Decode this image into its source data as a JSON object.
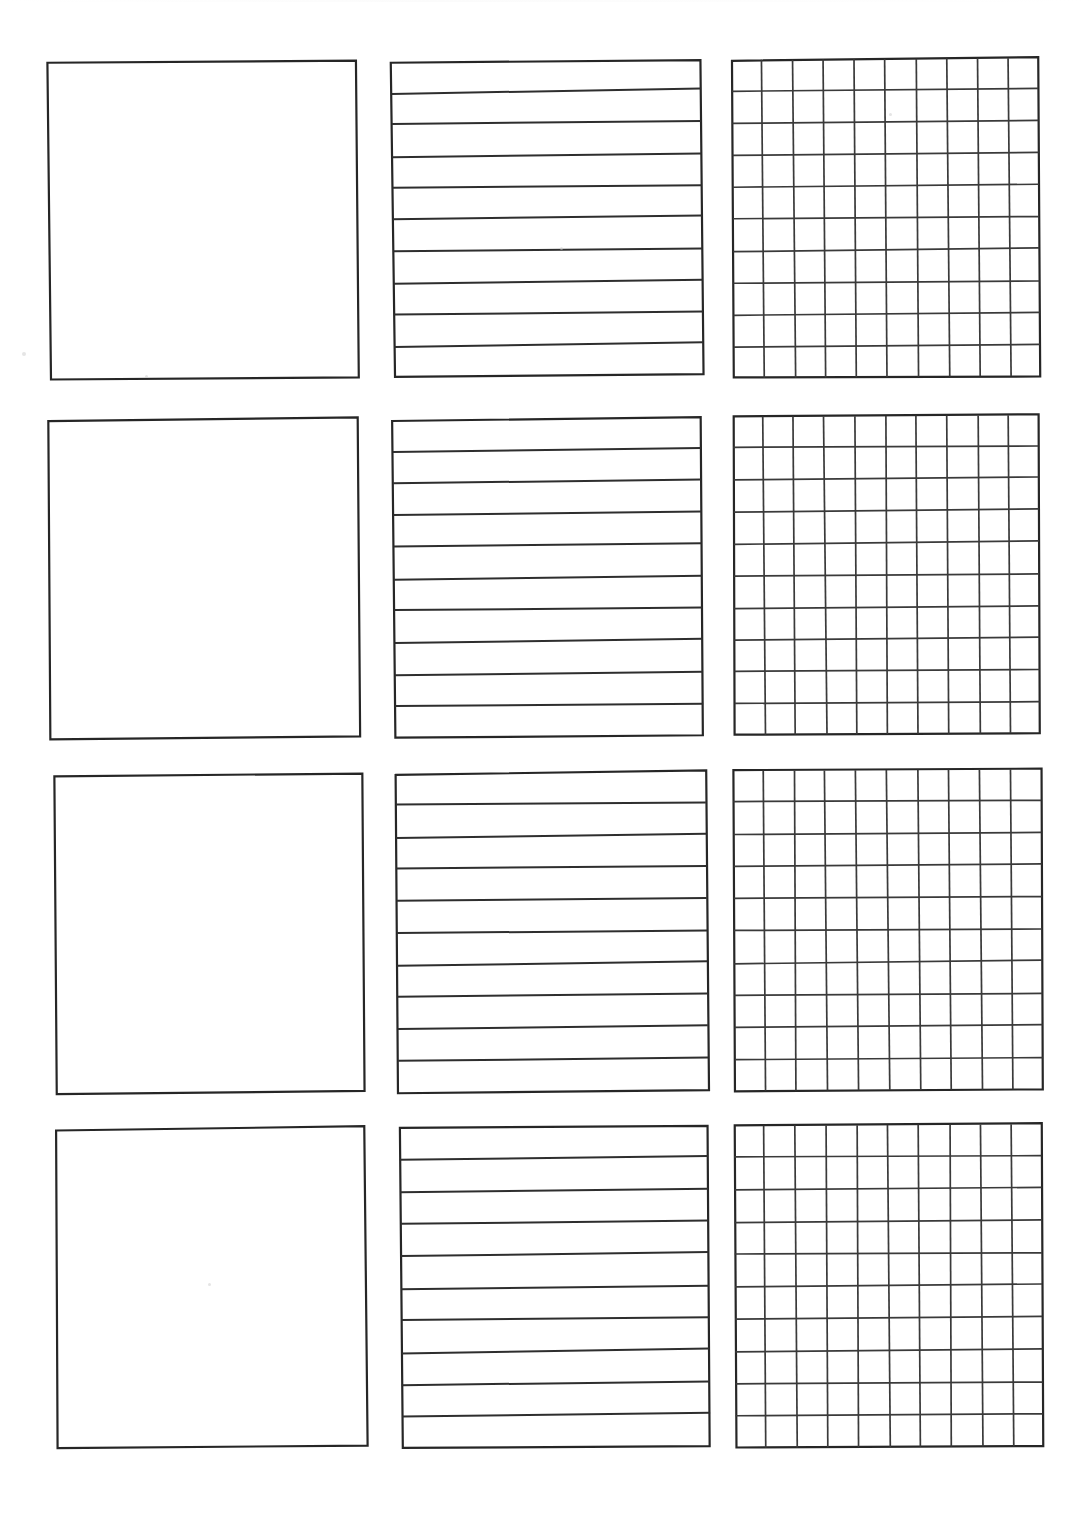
{
  "document": {
    "kind": "worksheet-template-sheet",
    "title": "Blank practice worksheet sheet",
    "page_width": 1090,
    "page_height": 1532,
    "background_color": "#ffffff",
    "ink_color": "#2e2e2e",
    "row_count": 4,
    "column_count": 3,
    "column_kinds": [
      "blank",
      "lined",
      "grid"
    ]
  },
  "cells": [
    {
      "id": "r1c1",
      "name": "blank-box-1",
      "kind": "blank",
      "row": 1,
      "column": 1,
      "x": 48,
      "y": 61,
      "width": 311,
      "height": 318,
      "skew_deg": -0.5,
      "line_count": 0,
      "grid_rows": 0,
      "grid_cols": 0
    },
    {
      "id": "r1c2",
      "name": "lined-box-1",
      "kind": "lined",
      "row": 1,
      "column": 2,
      "x": 392,
      "y": 60,
      "width": 311,
      "height": 317,
      "skew_deg": -0.55,
      "line_count": 10,
      "grid_rows": 0,
      "grid_cols": 0
    },
    {
      "id": "r1c3",
      "name": "grid-box-1",
      "kind": "grid",
      "row": 1,
      "column": 3,
      "x": 732,
      "y": 58,
      "width": 308,
      "height": 320,
      "skew_deg": -0.4,
      "line_count": 0,
      "grid_rows": 10,
      "grid_cols": 10
    },
    {
      "id": "r2c1",
      "name": "blank-box-2",
      "kind": "blank",
      "row": 2,
      "column": 1,
      "x": 48,
      "y": 419,
      "width": 312,
      "height": 320,
      "skew_deg": -0.45,
      "line_count": 0,
      "grid_rows": 0,
      "grid_cols": 0
    },
    {
      "id": "r2c2",
      "name": "lined-box-2",
      "kind": "lined",
      "row": 2,
      "column": 2,
      "x": 393,
      "y": 418,
      "width": 310,
      "height": 319,
      "skew_deg": -0.5,
      "line_count": 10,
      "grid_rows": 0,
      "grid_cols": 0
    },
    {
      "id": "r2c3",
      "name": "grid-box-2",
      "kind": "grid",
      "row": 2,
      "column": 3,
      "x": 733,
      "y": 415,
      "width": 307,
      "height": 320,
      "skew_deg": -0.35,
      "line_count": 0,
      "grid_rows": 10,
      "grid_cols": 10
    },
    {
      "id": "r3c1",
      "name": "blank-box-3",
      "kind": "blank",
      "row": 3,
      "column": 1,
      "x": 54,
      "y": 774,
      "width": 311,
      "height": 319,
      "skew_deg": -0.45,
      "line_count": 0,
      "grid_rows": 0,
      "grid_cols": 0
    },
    {
      "id": "r3c2",
      "name": "lined-box-3",
      "kind": "lined",
      "row": 3,
      "column": 2,
      "x": 396,
      "y": 772,
      "width": 312,
      "height": 320,
      "skew_deg": -0.5,
      "line_count": 10,
      "grid_rows": 0,
      "grid_cols": 0
    },
    {
      "id": "r3c3",
      "name": "grid-box-3",
      "kind": "grid",
      "row": 3,
      "column": 3,
      "x": 733,
      "y": 769,
      "width": 310,
      "height": 322,
      "skew_deg": -0.35,
      "line_count": 0,
      "grid_rows": 10,
      "grid_cols": 10
    },
    {
      "id": "r4c1",
      "name": "blank-box-4",
      "kind": "blank",
      "row": 4,
      "column": 1,
      "x": 56,
      "y": 1128,
      "width": 311,
      "height": 320,
      "skew_deg": -0.45,
      "line_count": 0,
      "grid_rows": 0,
      "grid_cols": 0
    },
    {
      "id": "r4c2",
      "name": "lined-box-4",
      "kind": "lined",
      "row": 4,
      "column": 2,
      "x": 400,
      "y": 1126,
      "width": 310,
      "height": 322,
      "skew_deg": -0.5,
      "line_count": 10,
      "grid_rows": 0,
      "grid_cols": 0
    },
    {
      "id": "r4c3",
      "name": "grid-box-4",
      "kind": "grid",
      "row": 4,
      "column": 3,
      "x": 734,
      "y": 1124,
      "width": 309,
      "height": 324,
      "skew_deg": -0.3,
      "line_count": 0,
      "grid_rows": 10,
      "grid_cols": 10
    }
  ],
  "scan_artifacts": [
    {
      "name": "speck-left-margin",
      "x": 22,
      "y": 352,
      "size": 4
    },
    {
      "name": "speck-blank-1-bottom",
      "x": 145,
      "y": 375,
      "size": 3
    },
    {
      "name": "speck-grid-1-mid",
      "x": 889,
      "y": 113,
      "size": 3
    },
    {
      "name": "speck-lined-1-mid",
      "x": 560,
      "y": 247,
      "size": 3
    },
    {
      "name": "speck-blank-4-mid",
      "x": 208,
      "y": 1283,
      "size": 3
    }
  ]
}
